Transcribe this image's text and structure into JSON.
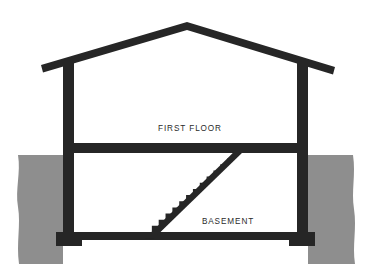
{
  "figure": {
    "type": "architectural-section",
    "width": 374,
    "height": 264,
    "background_color": "#ffffff"
  },
  "colors": {
    "structure": "#262626",
    "soil": "#8e8e8e",
    "interior": "#ffffff",
    "label": "#2b2b2b"
  },
  "labels": {
    "first_floor": "FIRST FLOOR",
    "basement": "BASEMENT"
  },
  "label_positions": {
    "first_floor": {
      "x": 190,
      "y": 131
    },
    "basement": {
      "x": 228,
      "y": 224
    }
  },
  "geometry": {
    "roof": {
      "peak": {
        "x": 187,
        "y": 22
      },
      "left_eave": {
        "x": 42,
        "y": 66
      },
      "right_eave": {
        "x": 333,
        "y": 68
      },
      "thickness": 6.5
    },
    "walls": {
      "left": {
        "x": 63,
        "width": 11,
        "top": 60,
        "bottom": 240
      },
      "right": {
        "x": 297,
        "width": 11,
        "top": 62,
        "bottom": 240
      }
    },
    "first_floor_slab": {
      "x": 63,
      "y": 143,
      "width": 245,
      "height": 10
    },
    "basement_slab": {
      "x": 63,
      "y": 232,
      "width": 245,
      "height": 8
    },
    "footings": [
      {
        "x": 56,
        "y": 232,
        "width": 26,
        "height": 14
      },
      {
        "x": 289,
        "y": 232,
        "width": 26,
        "height": 14
      }
    ],
    "ground_line_y": 155,
    "soil_left": {
      "x": 18,
      "y": 155,
      "width": 45,
      "height": 109
    },
    "soil_right": {
      "x": 308,
      "y": 155,
      "width": 47,
      "height": 109
    },
    "stair": {
      "bottom": {
        "x": 145,
        "y": 232
      },
      "top": {
        "x": 234,
        "y": 152
      },
      "step_count": 13,
      "stringer_thickness": 9
    }
  },
  "chart_data": {
    "type": "diagram",
    "annotations": [
      "FIRST FLOOR",
      "BASEMENT"
    ],
    "elements": [
      "gable-roof",
      "left-exterior-wall",
      "right-exterior-wall",
      "first-floor-slab",
      "basement-slab",
      "left-footing",
      "right-footing",
      "basement-stair",
      "soil-left",
      "soil-right"
    ]
  }
}
